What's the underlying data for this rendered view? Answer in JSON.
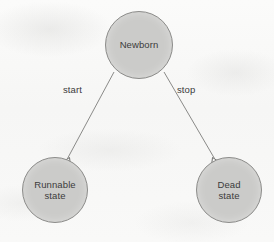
{
  "diagram": {
    "background_color": "#f8f8f7",
    "node_fill_color": "#cbcbc9",
    "node_border_color": "#8d8d8b",
    "edge_color": "#8a8a88",
    "text_color": "#3b3b3b",
    "nodes": [
      {
        "id": "newborn",
        "label": "Newborn",
        "shape": "circle",
        "cx": 139,
        "cy": 45,
        "r": 34
      },
      {
        "id": "runnable",
        "label": "Runnable\nstate",
        "shape": "circle",
        "cx": 55,
        "cy": 190,
        "r": 33
      },
      {
        "id": "dead",
        "label": "Dead\nstate",
        "shape": "circle",
        "cx": 229,
        "cy": 190,
        "r": 33
      }
    ],
    "edges": [
      {
        "id": "start",
        "label": "start",
        "from": "newborn",
        "to": "runnable",
        "x1": 114,
        "y1": 72,
        "x2": 66,
        "y2": 160,
        "arrowhead": "open-v"
      },
      {
        "id": "stop",
        "label": "stop",
        "from": "newborn",
        "to": "dead",
        "x1": 164,
        "y1": 72,
        "x2": 215,
        "y2": 160,
        "arrowhead": "open-v"
      }
    ]
  }
}
